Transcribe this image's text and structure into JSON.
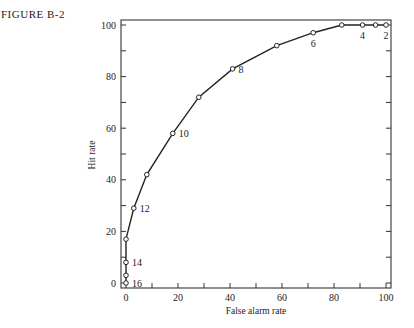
{
  "figure": {
    "label": "FIGURE B-2"
  },
  "chart_data": {
    "type": "line",
    "title": "",
    "figure_label": "FIGURE B-2",
    "xlabel": "False alarm rate",
    "ylabel": "Hit rate",
    "xlim": [
      0,
      100
    ],
    "ylim": [
      0,
      100
    ],
    "grid": false,
    "legend": null,
    "x_ticks": [
      0,
      10,
      20,
      30,
      40,
      50,
      60,
      70,
      80,
      90,
      100
    ],
    "x_tick_labels": [
      "0",
      "20",
      "40",
      "60",
      "80",
      "100"
    ],
    "x_tick_label_values": [
      0,
      20,
      40,
      60,
      80,
      100
    ],
    "y_ticks": [
      0,
      10,
      20,
      30,
      40,
      50,
      60,
      70,
      80,
      90,
      100
    ],
    "y_tick_labels": [
      "0",
      "20",
      "40",
      "60",
      "80",
      "100"
    ],
    "y_tick_label_values": [
      0,
      20,
      40,
      60,
      80,
      100
    ],
    "series": [
      {
        "name": "ROC curve",
        "marker": "open-circle",
        "points": [
          {
            "x": 0,
            "y": 0,
            "label": "16"
          },
          {
            "x": 0,
            "y": 3,
            "label": ""
          },
          {
            "x": 0,
            "y": 8,
            "label": "14"
          },
          {
            "x": 0,
            "y": 17,
            "label": ""
          },
          {
            "x": 3,
            "y": 29,
            "label": "12"
          },
          {
            "x": 8,
            "y": 42,
            "label": ""
          },
          {
            "x": 18,
            "y": 58,
            "label": "10"
          },
          {
            "x": 28,
            "y": 72,
            "label": ""
          },
          {
            "x": 41,
            "y": 83,
            "label": "8"
          },
          {
            "x": 58,
            "y": 92,
            "label": ""
          },
          {
            "x": 72,
            "y": 97,
            "label": "6"
          },
          {
            "x": 83,
            "y": 100,
            "label": ""
          },
          {
            "x": 91,
            "y": 100,
            "label": "4"
          },
          {
            "x": 96,
            "y": 100,
            "label": ""
          },
          {
            "x": 100,
            "y": 100,
            "label": "2"
          }
        ]
      }
    ]
  }
}
